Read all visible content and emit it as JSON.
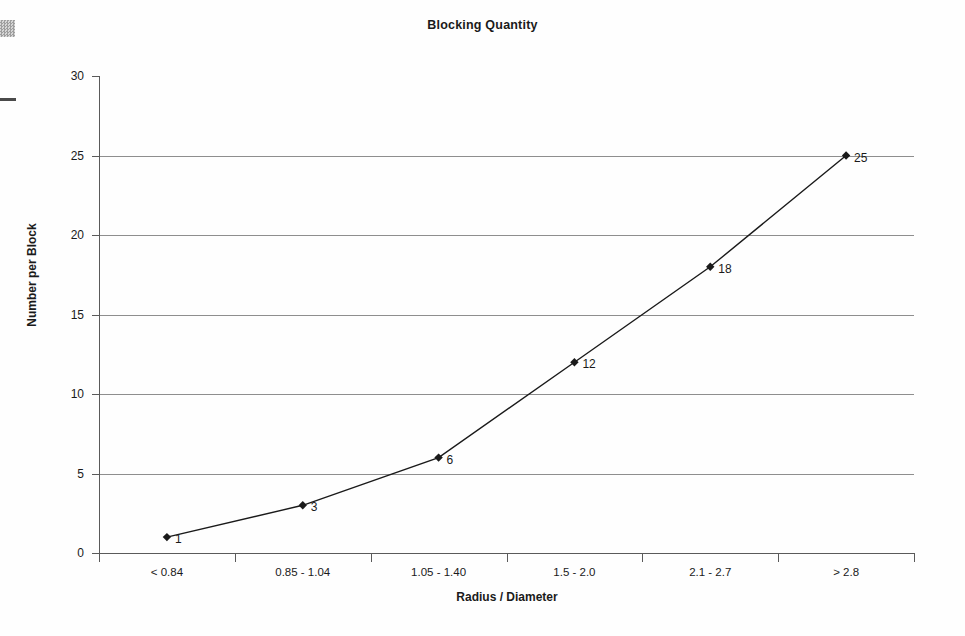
{
  "artifacts": {
    "left_margin_square": "scan-artifact-square",
    "left_margin_dash": "scan-artifact-dash"
  },
  "chart_data": {
    "type": "line",
    "title": "Blocking Quantity",
    "xlabel": "Radius / Diameter",
    "ylabel": "Number per Block",
    "categories": [
      "< 0.84",
      "0.85 - 1.04",
      "1.05 - 1.40",
      "1.5 - 2.0",
      "2.1 - 2.7",
      "> 2.8"
    ],
    "values": [
      1,
      3,
      6,
      12,
      18,
      25
    ],
    "point_labels": [
      "1",
      "3",
      "6",
      "12",
      "18",
      "25"
    ],
    "ylim": [
      0,
      30
    ],
    "yticks": [
      0,
      5,
      10,
      15,
      20,
      25,
      30
    ],
    "ytick_labels": [
      "0",
      "5",
      "10",
      "15",
      "20",
      "25",
      "30"
    ],
    "grid": "horizontal",
    "legend": "none",
    "marker": "diamond",
    "line_color": "#1a1a1a",
    "grid_color": "#8e8e8e"
  }
}
